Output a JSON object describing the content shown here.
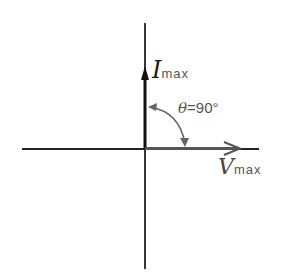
{
  "diagram": {
    "type": "phasor-diagram",
    "vectors": [
      {
        "name": "current",
        "symbol": "I",
        "subscript": "max",
        "direction": "up",
        "color": "#111111"
      },
      {
        "name": "voltage",
        "symbol": "V",
        "subscript": "max",
        "direction": "right",
        "color": "#555555"
      }
    ],
    "angle": {
      "symbol": "θ",
      "equals": "=",
      "value": "90°"
    },
    "colors": {
      "axis": "#222222",
      "current": "#111111",
      "voltage": "#555555",
      "arc": "#666666"
    }
  }
}
